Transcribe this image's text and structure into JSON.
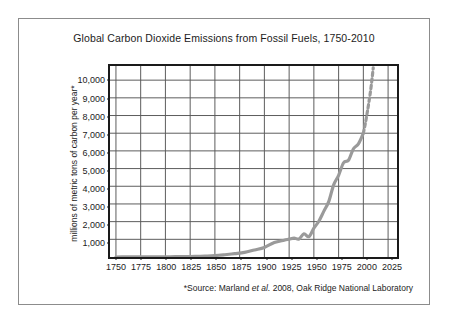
{
  "chart_data": {
    "type": "line",
    "title": "Global Carbon Dioxide Emissions from Fossil Fuels, 1750-2010",
    "xlabel": "",
    "ylabel": "millions of metric tons of carbon per year*",
    "xlim": [
      1744,
      2034
    ],
    "ylim": [
      0,
      10800
    ],
    "grid": true,
    "legend": null,
    "x_ticks": [
      1750,
      1775,
      1800,
      1825,
      1850,
      1875,
      1900,
      1925,
      1950,
      1975,
      2000,
      2025
    ],
    "x_tick_labels": [
      "1750",
      "1775",
      "1800",
      "1825",
      "1850",
      "1875",
      "1900",
      "1925",
      "1950",
      "1975",
      "2000",
      "2025"
    ],
    "y_ticks": [
      1000,
      2000,
      3000,
      4000,
      5000,
      6000,
      7000,
      8000,
      9000,
      10000
    ],
    "y_tick_labels": [
      "1,000",
      "2,000",
      "3,000",
      "4,000",
      "5,000",
      "6,000",
      "7,000",
      "8,000",
      "9,000",
      "10,000"
    ],
    "series": [
      {
        "name": "Global CO2 emissions from fossil fuels",
        "color": "#9a9a9a",
        "style": "solid",
        "x": [
          1750,
          1760,
          1770,
          1780,
          1790,
          1800,
          1810,
          1820,
          1830,
          1840,
          1850,
          1860,
          1870,
          1880,
          1890,
          1900,
          1910,
          1920,
          1925,
          1930,
          1935,
          1940,
          1945,
          1950,
          1955,
          1960,
          1965,
          1970,
          1975,
          1980,
          1985,
          1990,
          1995,
          2000
        ],
        "y": [
          3,
          4,
          5,
          7,
          9,
          12,
          18,
          25,
          36,
          54,
          80,
          130,
          190,
          260,
          400,
          540,
          820,
          950,
          1010,
          1070,
          1020,
          1310,
          1150,
          1630,
          2020,
          2580,
          3130,
          4080,
          4620,
          5330,
          5470,
          6120,
          6400,
          7000
        ]
      },
      {
        "name": "Projection",
        "color": "#9a9a9a",
        "style": "dashed",
        "x": [
          2000,
          2002,
          2004,
          2006,
          2008,
          2010
        ],
        "y": [
          7000,
          7550,
          8200,
          8900,
          9700,
          10700
        ]
      }
    ],
    "source_note": "*Source: Marland ",
    "source_note_italic": "et al.",
    "source_note_tail": " 2008, Oak Ridge National Laboratory"
  }
}
